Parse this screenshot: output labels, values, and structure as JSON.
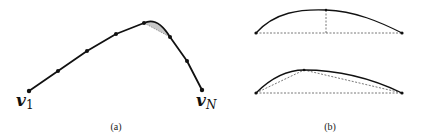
{
  "figure": {
    "panel_a": {
      "caption": "(a)",
      "start_label": "v",
      "start_sub": "1",
      "end_label": "v",
      "end_sub": "N",
      "points": [
        [
          29,
          91
        ],
        [
          58,
          71
        ],
        [
          87,
          51
        ],
        [
          116,
          34
        ],
        [
          144,
          23
        ],
        [
          170,
          37
        ],
        [
          187,
          61
        ],
        [
          202,
          90
        ]
      ],
      "shaded_region": "between chord and curve from point 5 to point 6",
      "shade_color": "#c8c8c8"
    },
    "panel_b": {
      "caption": "(b)",
      "top": {
        "left": [
          256,
          33
        ],
        "right": [
          402,
          33
        ],
        "peak": [
          326,
          10
        ],
        "dashed_vertical_x": 326
      },
      "bottom": {
        "left": [
          256,
          93
        ],
        "right": [
          402,
          93
        ],
        "split_point": [
          304,
          70
        ]
      }
    },
    "colors": {
      "curve": "#111111",
      "dashed": "#555555"
    }
  }
}
